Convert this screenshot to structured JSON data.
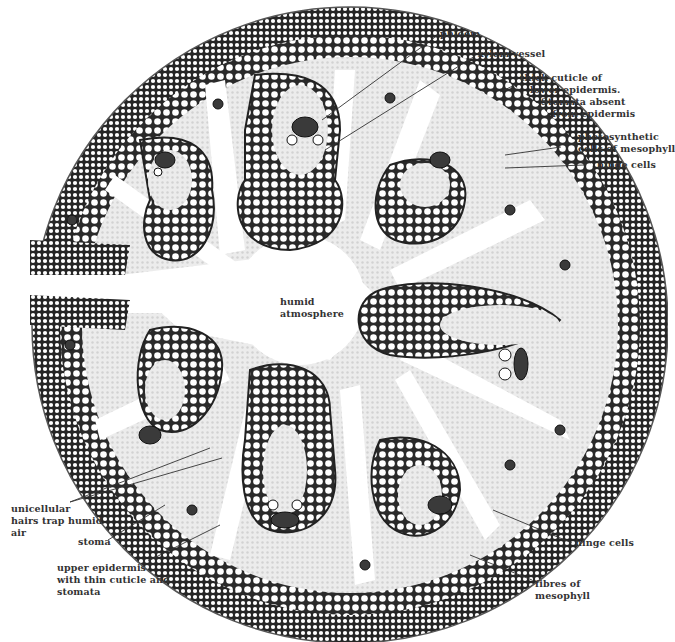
{
  "diagram": {
    "center_label": "humid atmosphere",
    "labels": {
      "phloem": "phloem",
      "xylem_vessel": "xylem vessel",
      "thick_cuticle": [
        "thick cuticle of",
        "lower epidermis.",
        "Stomata absent",
        "from epidermis"
      ],
      "photosynthetic": [
        "photosynthetic",
        "cells of mesophyll"
      ],
      "hinge_cells_top": "hinge cells",
      "humid_atmosphere": [
        "humid",
        "atmosphere"
      ],
      "unicellular_hairs": [
        "unicellular",
        "hairs trap humid",
        "air"
      ],
      "stoma": "stoma",
      "upper_epidermis": [
        "upper epidermis",
        "with thin cuticle and",
        "stomata"
      ],
      "hinge_cells_bottom": "hinge cells",
      "fibres": [
        "fibres of",
        "mesophyll"
      ]
    },
    "colors": {
      "ink": "#1e1e1e",
      "fibre_dark": "#2a2a2a",
      "mesophyll": "#e6e6e6",
      "background": "#ffffff",
      "label_text": "#333333"
    }
  }
}
